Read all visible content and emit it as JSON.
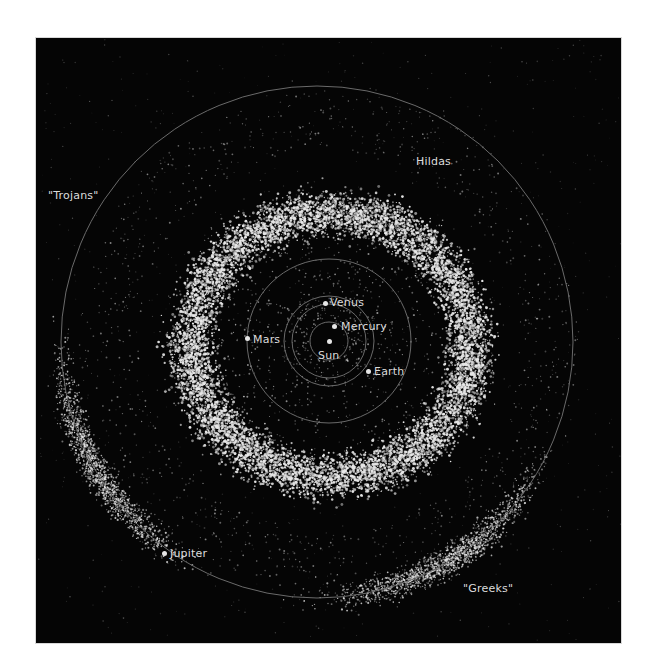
{
  "diagram": {
    "background_color": "#050505",
    "orbit_color": "#6a6a6a",
    "asteroid_color": "#e8e8e8",
    "sun": {
      "label": "Sun",
      "x": 329,
      "y": 341
    },
    "planets": [
      {
        "name": "Mercury",
        "label": "Mercury",
        "dot_x": 334,
        "dot_y": 326,
        "label_x": 341,
        "label_y": 321,
        "orbit_r": 19
      },
      {
        "name": "Venus",
        "label": "Venus",
        "dot_x": 325,
        "dot_y": 303,
        "label_x": 331,
        "label_y": 298,
        "orbit_r": 37
      },
      {
        "name": "Earth",
        "label": "Earth",
        "dot_x": 368,
        "dot_y": 371,
        "label_x": 375,
        "label_y": 366,
        "orbit_r": 45
      },
      {
        "name": "Mars",
        "label": "Mars",
        "dot_x": 248,
        "dot_y": 339,
        "label_x": 255,
        "label_y": 334,
        "orbit_r": 82
      },
      {
        "name": "Jupiter",
        "label": "Jupiter",
        "dot_x": 165,
        "dot_y": 554,
        "label_x": 172,
        "label_y": 548,
        "orbit_r": 258
      }
    ],
    "groups": [
      {
        "name": "trojans",
        "label": "\"Trojans\"",
        "x": 48,
        "y": 190
      },
      {
        "name": "hildas",
        "label": "Hildas",
        "x": 416,
        "y": 156
      },
      {
        "name": "greeks",
        "label": "\"Greeks\"",
        "x": 463,
        "y": 589
      }
    ],
    "main_belt": {
      "inner_r": 95,
      "outer_r": 165
    }
  }
}
